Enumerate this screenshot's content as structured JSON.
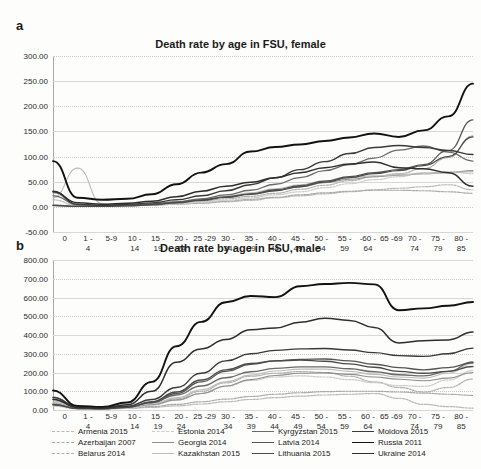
{
  "figure": {
    "panels": [
      {
        "letter": "a",
        "title": "Death rate by age in FSU, female"
      },
      {
        "letter": "b",
        "title": "Death rate by age in FSU, male"
      }
    ]
  },
  "legend": {
    "entries": [
      {
        "label": "Armenia 2015",
        "color": "#b9b9b9",
        "style": "dotted",
        "width": 1.2
      },
      {
        "label": "Azerbaijan 2007",
        "color": "#a9a9a9",
        "style": "dotted",
        "width": 1.2
      },
      {
        "label": "Belarus 2014",
        "color": "#b0b0b0",
        "style": "dotted",
        "width": 1.2
      },
      {
        "label": "Estonia 2014",
        "color": "#cccccc",
        "style": "dotted",
        "width": 1.2
      },
      {
        "label": "Georgia 2014",
        "color": "#8f8f8f",
        "style": "solid",
        "width": 1.1
      },
      {
        "label": "Kazakhstan 2015",
        "color": "#bcbcbc",
        "style": "solid",
        "width": 1.1
      },
      {
        "label": "Kyrgyzstan 2015",
        "color": "#6a6a6a",
        "style": "solid",
        "width": 1.3
      },
      {
        "label": "Latvia 2014",
        "color": "#555555",
        "style": "solid",
        "width": 1.3
      },
      {
        "label": "Lithuania 2015",
        "color": "#4a4a4a",
        "style": "solid",
        "width": 1.3
      },
      {
        "label": "Moldova 2015",
        "color": "#3a3a3a",
        "style": "solid",
        "width": 1.4
      },
      {
        "label": "Russia 2011",
        "color": "#121212",
        "style": "solid",
        "width": 1.9
      },
      {
        "label": "Ukraine 2014",
        "color": "#2e2e2e",
        "style": "solid",
        "width": 1.5
      }
    ]
  },
  "chart_data": [
    {
      "type": "line",
      "title": "Death rate by age in FSU, female",
      "panel": "a",
      "xlabel": "",
      "ylabel": "",
      "grid": true,
      "legend_position": "bottom",
      "ylim": [
        -50,
        300
      ],
      "yticks": [
        -50,
        0,
        50,
        100,
        150,
        200,
        250,
        300
      ],
      "ytick_labels": [
        "-50.00",
        "0.00",
        "50.00",
        "100.00",
        "150.00",
        "200.00",
        "250.00",
        "300.00"
      ],
      "categories": [
        "0",
        "1 - 4",
        "5-9",
        "10 - 14",
        "15 - 19",
        "20 - 24",
        "25 -29",
        "30 - 34",
        "35 - 39",
        "40 - 44",
        "45 - 49",
        "50 - 54",
        "55 - 59",
        "-60 - 64",
        "65 -69",
        "70 - 74",
        "75 - 79",
        "80 - 85"
      ],
      "series": [
        {
          "name": "Armenia 2015",
          "values": [
            14,
            2,
            1,
            2,
            3,
            5,
            7,
            10,
            13,
            18,
            22,
            26,
            30,
            34,
            37,
            40,
            44,
            34
          ]
        },
        {
          "name": "Azerbaijan 2007",
          "values": [
            30,
            3,
            2,
            3,
            4,
            6,
            8,
            11,
            15,
            19,
            24,
            28,
            31,
            33,
            33,
            32,
            30,
            27
          ]
        },
        {
          "name": "Belarus 2014",
          "values": [
            4,
            1,
            1,
            2,
            4,
            7,
            11,
            16,
            21,
            27,
            35,
            43,
            52,
            60,
            66,
            76,
            98,
            141
          ]
        },
        {
          "name": "Estonia 2014",
          "values": [
            2,
            1,
            1,
            2,
            3,
            6,
            9,
            13,
            18,
            24,
            30,
            38,
            46,
            54,
            60,
            68,
            70,
            66
          ]
        },
        {
          "name": "Georgia 2014",
          "values": [
            28,
            4,
            2,
            3,
            5,
            9,
            14,
            20,
            26,
            33,
            40,
            48,
            55,
            60,
            63,
            66,
            68,
            72
          ]
        },
        {
          "name": "Kazakhstan 2015",
          "values": [
            18,
            77,
            6,
            4,
            6,
            10,
            15,
            21,
            28,
            36,
            44,
            52,
            58,
            62,
            64,
            66,
            68,
            70
          ]
        },
        {
          "name": "Kyrgyzstan 2015",
          "values": [
            22,
            5,
            3,
            4,
            6,
            10,
            16,
            24,
            33,
            45,
            58,
            72,
            84,
            97,
            113,
            121,
            109,
            91
          ]
        },
        {
          "name": "Latvia 2014",
          "values": [
            3,
            1,
            1,
            3,
            5,
            9,
            14,
            20,
            26,
            34,
            42,
            51,
            60,
            68,
            74,
            84,
            112,
            173
          ]
        },
        {
          "name": "Lithuania 2015",
          "values": [
            3,
            1,
            1,
            2,
            4,
            8,
            13,
            19,
            25,
            32,
            40,
            49,
            58,
            66,
            72,
            82,
            100,
            139
          ]
        },
        {
          "name": "Moldova 2015",
          "values": [
            31,
            5,
            3,
            5,
            8,
            14,
            22,
            32,
            44,
            58,
            74,
            90,
            106,
            118,
            122,
            118,
            112,
            104
          ]
        },
        {
          "name": "Russia 2011",
          "values": [
            91,
            18,
            14,
            16,
            25,
            45,
            68,
            85,
            110,
            119,
            124,
            131,
            138,
            146,
            139,
            152,
            180,
            245
          ]
        },
        {
          "name": "Ukraine 2014",
          "values": [
            30,
            8,
            5,
            7,
            11,
            20,
            31,
            41,
            49,
            58,
            68,
            78,
            85,
            89,
            78,
            76,
            68,
            41
          ]
        }
      ]
    },
    {
      "type": "line",
      "title": "Death rate by age in FSU, male",
      "panel": "b",
      "xlabel": "",
      "ylabel": "",
      "grid": true,
      "legend_position": "bottom",
      "ylim": [
        0,
        800
      ],
      "yticks": [
        0,
        100,
        200,
        300,
        400,
        500,
        600,
        700,
        800
      ],
      "ytick_labels": [
        "0.00",
        "100.00",
        "200.00",
        "300.00",
        "400.00",
        "500.00",
        "600.00",
        "700.00",
        "800.00"
      ],
      "categories": [
        "0",
        "1 - 4",
        "5-9",
        "10 - 14",
        "15 - 19",
        "20 - 24",
        "25 -29",
        "30 - 34",
        "35 - 39",
        "40 - 44",
        "45 - 49",
        "50 - 54",
        "55 - 59",
        "60 - 64",
        "65 -69",
        "70 - 74",
        "75 - 79",
        "80 - 85"
      ],
      "series": [
        {
          "name": "Armenia 2015",
          "values": [
            40,
            10,
            6,
            8,
            14,
            22,
            32,
            44,
            56,
            66,
            74,
            80,
            84,
            88,
            62,
            30,
            18,
            10
          ]
        },
        {
          "name": "Azerbaijan 2007",
          "values": [
            35,
            12,
            8,
            10,
            18,
            30,
            44,
            58,
            72,
            84,
            92,
            98,
            100,
            100,
            96,
            90,
            84,
            78
          ]
        },
        {
          "name": "Belarus 2014",
          "values": [
            26,
            8,
            6,
            12,
            30,
            60,
            100,
            145,
            180,
            196,
            205,
            200,
            180,
            150,
            120,
            96,
            120,
            165
          ]
        },
        {
          "name": "Estonia 2014",
          "values": [
            20,
            6,
            5,
            10,
            26,
            52,
            88,
            126,
            158,
            176,
            182,
            176,
            162,
            146,
            130,
            126,
            160,
            210
          ]
        },
        {
          "name": "Georgia 2014",
          "values": [
            58,
            14,
            9,
            14,
            28,
            54,
            88,
            128,
            162,
            184,
            196,
            198,
            190,
            176,
            164,
            156,
            170,
            200
          ]
        },
        {
          "name": "Kazakhstan 2015",
          "values": [
            48,
            20,
            10,
            14,
            34,
            66,
            108,
            150,
            186,
            208,
            218,
            218,
            206,
            190,
            176,
            170,
            196,
            248
          ]
        },
        {
          "name": "Kyrgyzstan 2015",
          "values": [
            68,
            16,
            10,
            16,
            40,
            80,
            128,
            172,
            204,
            222,
            230,
            230,
            220,
            204,
            188,
            182,
            206,
            256
          ]
        },
        {
          "name": "Latvia 2014",
          "values": [
            30,
            8,
            6,
            14,
            40,
            88,
            150,
            206,
            244,
            262,
            270,
            272,
            262,
            244,
            226,
            214,
            226,
            252
          ]
        },
        {
          "name": "Lithuania 2015",
          "values": [
            28,
            8,
            6,
            14,
            44,
            96,
            160,
            214,
            248,
            262,
            266,
            260,
            246,
            228,
            206,
            196,
            206,
            232
          ]
        },
        {
          "name": "Moldova 2015",
          "values": [
            66,
            18,
            12,
            20,
            56,
            120,
            196,
            262,
            300,
            318,
            326,
            328,
            320,
            306,
            290,
            286,
            300,
            330
          ]
        },
        {
          "name": "Russia 2011",
          "values": [
            104,
            22,
            16,
            40,
            150,
            340,
            470,
            575,
            608,
            602,
            660,
            672,
            678,
            670,
            532,
            542,
            556,
            576
          ]
        },
        {
          "name": "Ukraine 2014",
          "values": [
            56,
            14,
            10,
            28,
            100,
            255,
            326,
            376,
            428,
            438,
            468,
            490,
            478,
            440,
            358,
            370,
            374,
            416
          ]
        }
      ]
    }
  ]
}
